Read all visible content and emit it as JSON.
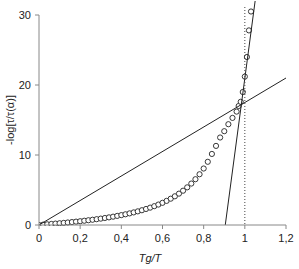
{
  "chart_data": {
    "type": "scatter",
    "title": "",
    "xlabel": "Tg/T",
    "ylabel": "-log[τ/τ(α)]",
    "xlim": [
      0,
      1.2
    ],
    "ylim": [
      0,
      30
    ],
    "x_ticks": [
      "0",
      "0,2",
      "0,4",
      "0,6",
      "0,8",
      "1",
      "1,2"
    ],
    "y_ticks": [
      "0",
      "10",
      "20",
      "30"
    ],
    "grid": false,
    "legend": null,
    "series": [
      {
        "name": "data",
        "kind": "markers",
        "marker": "open-circle",
        "x": [
          0.0,
          0.02,
          0.04,
          0.06,
          0.08,
          0.1,
          0.12,
          0.14,
          0.16,
          0.18,
          0.2,
          0.22,
          0.24,
          0.26,
          0.28,
          0.3,
          0.32,
          0.34,
          0.36,
          0.38,
          0.4,
          0.42,
          0.44,
          0.46,
          0.48,
          0.5,
          0.52,
          0.54,
          0.56,
          0.58,
          0.6,
          0.62,
          0.64,
          0.66,
          0.68,
          0.7,
          0.72,
          0.74,
          0.76,
          0.78,
          0.8,
          0.82,
          0.84,
          0.86,
          0.88,
          0.9,
          0.92,
          0.94,
          0.96,
          0.97,
          0.98,
          0.99,
          1.0,
          1.01,
          1.02,
          1.03
        ],
        "y": [
          0.0,
          0.05,
          0.1,
          0.15,
          0.2,
          0.25,
          0.3,
          0.36,
          0.42,
          0.48,
          0.54,
          0.61,
          0.68,
          0.75,
          0.83,
          0.91,
          1.0,
          1.09,
          1.19,
          1.3,
          1.41,
          1.53,
          1.66,
          1.8,
          1.95,
          2.11,
          2.29,
          2.48,
          2.69,
          2.92,
          3.17,
          3.45,
          3.76,
          4.1,
          4.48,
          4.9,
          5.38,
          5.92,
          6.54,
          7.25,
          8.07,
          9.03,
          10.15,
          11.3,
          12.5,
          13.4,
          14.4,
          15.3,
          16.2,
          17.0,
          17.6,
          19.0,
          21.2,
          24.0,
          27.8,
          30.5
        ]
      },
      {
        "name": "low-slope line",
        "kind": "line",
        "points": [
          [
            0,
            0
          ],
          [
            1.2,
            21
          ]
        ]
      },
      {
        "name": "high-slope line",
        "kind": "line",
        "points": [
          [
            0.905,
            0
          ],
          [
            1.05,
            32
          ]
        ]
      },
      {
        "name": "Tg marker",
        "kind": "dotted-vertical",
        "x": 1.0
      }
    ]
  }
}
